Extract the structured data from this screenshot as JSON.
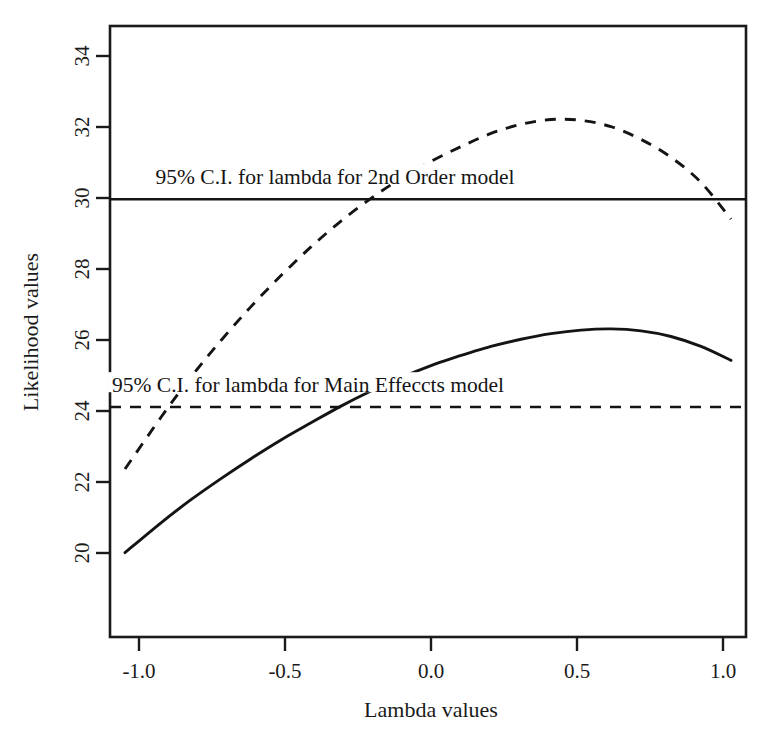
{
  "chart_data": {
    "type": "line",
    "title": "",
    "subtitle": "",
    "xlabel": "Lambda values",
    "ylabel": "Likelihood values",
    "xlim": [
      -1.07,
      1.05
    ],
    "ylim": [
      19.4,
      34.75
    ],
    "xticks": [
      "-1.0",
      "-0.5",
      "0.0",
      "0.5",
      "1.0"
    ],
    "xtick_values": [
      -1.0,
      -0.5,
      0.0,
      0.5,
      1.0
    ],
    "yticks": [
      "20",
      "22",
      "24",
      "26",
      "28",
      "30",
      "32",
      "34"
    ],
    "ytick_values": [
      20,
      22,
      24,
      26,
      28,
      30,
      32,
      34
    ],
    "grid": false,
    "legend": "none (inline annotations)",
    "frame": "box",
    "series": [
      {
        "name": "Main Effects model log-likelihood",
        "style": "solid",
        "color": "#141414",
        "peak_x": 0.07,
        "peak_y": 27.15,
        "x": [
          -1.02,
          -0.9,
          -0.8,
          -0.7,
          -0.6,
          -0.5,
          -0.4,
          -0.3,
          -0.2,
          -0.1,
          0.0,
          0.07,
          0.2,
          0.3,
          0.4,
          0.5,
          0.6,
          0.7,
          0.8,
          0.9,
          1.0
        ],
        "values": [
          21.52,
          22.27,
          22.85,
          23.38,
          23.88,
          24.35,
          24.78,
          25.2,
          25.58,
          25.92,
          26.22,
          26.4,
          26.7,
          26.88,
          27.02,
          27.11,
          27.14,
          27.09,
          26.95,
          26.7,
          26.35
        ]
      },
      {
        "name": "2nd Order model log-likelihood",
        "style": "dashed",
        "color": "#141414",
        "peak_x": 0.3,
        "peak_y": 32.4,
        "x": [
          -1.02,
          -0.9,
          -0.8,
          -0.7,
          -0.6,
          -0.5,
          -0.4,
          -0.3,
          -0.2,
          -0.1,
          0.0,
          0.1,
          0.2,
          0.3,
          0.4,
          0.5,
          0.6,
          0.7,
          0.8,
          0.9,
          1.0
        ],
        "values": [
          23.62,
          24.92,
          25.93,
          26.85,
          27.7,
          28.48,
          29.2,
          29.85,
          30.42,
          30.92,
          31.35,
          31.72,
          32.05,
          32.28,
          32.4,
          32.38,
          32.22,
          31.9,
          31.45,
          30.82,
          29.9
        ]
      }
    ],
    "reference_lines": [
      {
        "name": "ci-line-main-effects",
        "orientation": "horizontal",
        "y": 25.18,
        "style": "solid",
        "label": "95% C.I. for lambda for Main Effeccts model",
        "label_x": -0.41,
        "label_y": 25.55
      },
      {
        "name": "ci-line-2nd-order",
        "orientation": "horizontal",
        "y": 30.4,
        "style": "dashed",
        "label": "95% C.I. for lambda for 2nd Order model",
        "label_x": -0.32,
        "label_y": 30.78
      }
    ],
    "annotations": [
      {
        "text": "95% C.I. for lambda for 2nd Order model",
        "x": -0.32,
        "y": 30.78
      },
      {
        "text": "95% C.I. for lambda for Main Effeccts model",
        "x": -0.41,
        "y": 25.55
      }
    ]
  },
  "axis": {
    "x_title": "Lambda values",
    "y_title": "Likelihood values",
    "x_tick_labels": [
      "-1.0",
      "-0.5",
      "0.0",
      "0.5",
      "1.0"
    ],
    "y_tick_labels": [
      "20",
      "22",
      "24",
      "26",
      "28",
      "30",
      "32",
      "34"
    ]
  },
  "colors": {
    "ink": "#141414",
    "frame": "#1a1a1a",
    "background": "#ffffff"
  }
}
